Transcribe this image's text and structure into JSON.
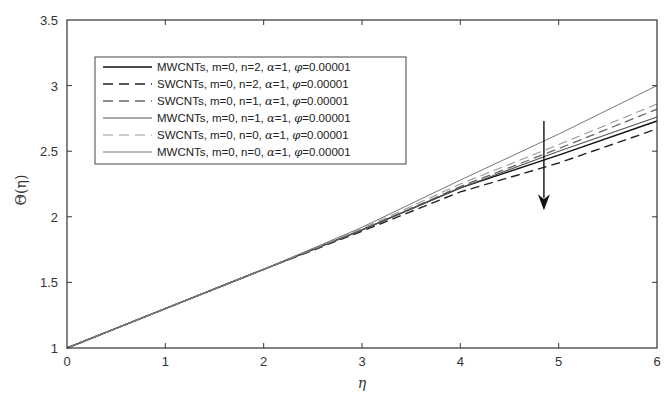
{
  "chart_data": {
    "type": "line",
    "title": "",
    "xlabel": "η",
    "ylabel": "Θ(η)",
    "xlim": [
      0,
      6
    ],
    "ylim": [
      1,
      3.5
    ],
    "xticks": [
      0,
      1,
      2,
      3,
      4,
      5,
      6
    ],
    "yticks": [
      1,
      1.5,
      2,
      2.5,
      3,
      3.5
    ],
    "xtick_labels": [
      "0",
      "1",
      "2",
      "3",
      "4",
      "5",
      "6"
    ],
    "ytick_labels": [
      "1",
      "1.5",
      "2",
      "2.5",
      "3",
      "3.5"
    ],
    "grid": false,
    "legend_position": "upper left",
    "x": [
      0,
      1,
      2,
      3,
      4,
      5,
      6
    ],
    "series": [
      {
        "name": "MWCNTs, m=0, n=2, α=1, φ=0.00001",
        "label_main": "MWCNTs, m=0, n=2, ",
        "style": "solid",
        "color": "#111111",
        "width": 1.4,
        "values": [
          1.0,
          1.3,
          1.6,
          1.9,
          2.22,
          2.47,
          2.73
        ]
      },
      {
        "name": "SWCNTs, m=0, n=2, α=1, φ=0.00001",
        "label_main": "SWCNTs, m=0, n=2, ",
        "style": "dashed",
        "color": "#222222",
        "width": 1.4,
        "values": [
          1.0,
          1.3,
          1.6,
          1.89,
          2.19,
          2.41,
          2.67
        ]
      },
      {
        "name": "SWCNTs, m=0, n=1, α=1, φ=0.00001",
        "label_main": "SWCNTs, m=0, n=1, ",
        "style": "dashed",
        "color": "#666666",
        "width": 1.3,
        "values": [
          1.0,
          1.3,
          1.6,
          1.9,
          2.23,
          2.52,
          2.82
        ]
      },
      {
        "name": "MWCNTs, m=0, n=1, α=1, φ=0.00001",
        "label_main": "MWCNTs, m=0, n=1, ",
        "style": "solid",
        "color": "#555555",
        "width": 1.1,
        "values": [
          1.0,
          1.3,
          1.6,
          1.9,
          2.22,
          2.5,
          2.76
        ]
      },
      {
        "name": "SWCNTs, m=0, n=0, α=1, φ=0.00001",
        "label_main": "SWCNTs, m=0, n=0, ",
        "style": "dashed",
        "color": "#999999",
        "width": 1.1,
        "values": [
          1.0,
          1.3,
          1.6,
          1.91,
          2.25,
          2.55,
          2.86
        ]
      },
      {
        "name": "MWCNTs, m=0, n=0, α=1, φ=0.00001",
        "label_main": "MWCNTs, m=0, n=0, ",
        "style": "solid",
        "color": "#777777",
        "width": 1.0,
        "values": [
          1.0,
          1.3,
          1.6,
          1.92,
          2.28,
          2.63,
          3.0
        ]
      }
    ],
    "legend_suffix": {
      "alpha": "α",
      "alpha_val": "=1, ",
      "phi": "φ",
      "phi_val": "=0.00001"
    },
    "annotations": [
      {
        "type": "arrow",
        "direction": "down",
        "x": 4.85,
        "y_from": 2.73,
        "y_to": 2.05,
        "meaning": "increasing n decreases Θ(η)"
      }
    ]
  }
}
